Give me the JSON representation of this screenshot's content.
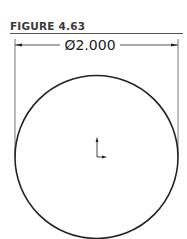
{
  "figure": {
    "title": "FIGURE 4.63",
    "dimension_label": "Ø2.000"
  },
  "drawing": {
    "shape": "circle",
    "diameter": "2.000",
    "line_color": "#222222",
    "dim_line_color": "#666666"
  }
}
